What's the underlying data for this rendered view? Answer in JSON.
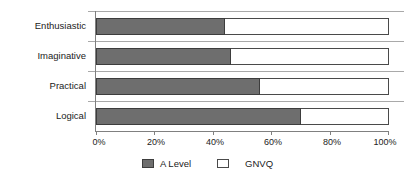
{
  "chart_data": {
    "type": "bar",
    "orientation": "horizontal",
    "stacked": true,
    "normalized_percent": true,
    "title": "",
    "subtitle": "",
    "xlabel": "",
    "ylabel": "",
    "categories": [
      "Enthusiastic",
      "Imaginative",
      "Practical",
      "Logical"
    ],
    "series": [
      {
        "name": "A Level",
        "color": "#6e6e6e",
        "values": [
          44,
          46,
          56,
          70
        ]
      },
      {
        "name": "GNVQ",
        "color": "#ffffff",
        "values": [
          56,
          54,
          44,
          30
        ]
      }
    ],
    "xlim": [
      0,
      100
    ],
    "xticks": [
      0,
      20,
      40,
      60,
      80,
      100
    ],
    "xtick_labels": [
      "0%",
      "20%",
      "40%",
      "60%",
      "80%",
      "100%"
    ],
    "grid": true,
    "grid_axis": "y",
    "legend": true,
    "legend_position": "bottom",
    "legend_entries": [
      "A Level",
      "GNVQ"
    ],
    "annotations": []
  },
  "axes": {
    "x_tick_labels": [
      "0%",
      "20%",
      "40%",
      "60%",
      "80%",
      "100%"
    ]
  },
  "legend": {
    "items": [
      {
        "label": "A Level",
        "swatch": "filled-square-icon"
      },
      {
        "label": "GNVQ",
        "swatch": "hollow-square-icon"
      }
    ]
  }
}
